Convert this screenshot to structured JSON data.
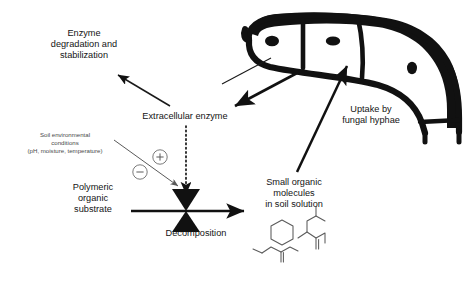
{
  "figure": {
    "background_color": "#ffffff",
    "ink_color": "#111111",
    "annotation_color": "#4a4a4a"
  },
  "labels": {
    "enzyme_degradation": "Enzyme\ndegradation and\nstabilization",
    "extracellular_enzyme": "Extracellular enzyme",
    "soil_conditions": "Soil environmental\nconditions\n(pH, moisture, temperature)",
    "polymeric_substrate": "Polymeric\norganic\nsubstrate",
    "decomposition": "Decomposition",
    "small_organic": "Small organic\nmolecules\nin soil solution",
    "uptake": "Uptake by\nfungal hyphae"
  },
  "signs": {
    "positive": "+",
    "negative": "−"
  },
  "icons": {
    "valve": "decomposition-valve-icon",
    "hyphae": "fungal-hyphae-icon",
    "molecules": "organic-molecule-sketch-icon"
  },
  "connectors": [
    {
      "name": "extracellular-enzyme-to-degradation",
      "from": "Extracellular enzyme",
      "to": "Enzyme degradation and stabilization",
      "style": "solid",
      "color": "#1a1a1a"
    },
    {
      "name": "hyphae-to-extracellular-enzyme",
      "from": "Fungal hyphae",
      "to": "Extracellular enzyme",
      "style": "solid-thick",
      "color": "#111111"
    },
    {
      "name": "extracellular-enzyme-to-decomposition",
      "from": "Extracellular enzyme",
      "to": "Decomposition valve",
      "style": "dotted",
      "color": "#141414"
    },
    {
      "name": "soil-conditions-to-decomposition",
      "from": "Soil environmental conditions",
      "to": "Decomposition valve",
      "style": "solid-thin",
      "color": "#5a5a5a"
    },
    {
      "name": "substrate-to-small-organic-flow",
      "from": "Polymeric organic substrate",
      "to": "Small organic molecules in soil solution",
      "style": "solid-thick",
      "color": "#111111"
    },
    {
      "name": "small-organic-to-hyphae-uptake",
      "from": "Small organic molecules in soil solution",
      "to": "Fungal hyphae",
      "style": "solid-thick",
      "color": "#111111"
    },
    {
      "name": "hyphae-leader-line",
      "from": "Fungal hyphae",
      "to": "Extracellular enzyme region",
      "style": "solid-thin",
      "color": "#1a1a1a"
    }
  ]
}
